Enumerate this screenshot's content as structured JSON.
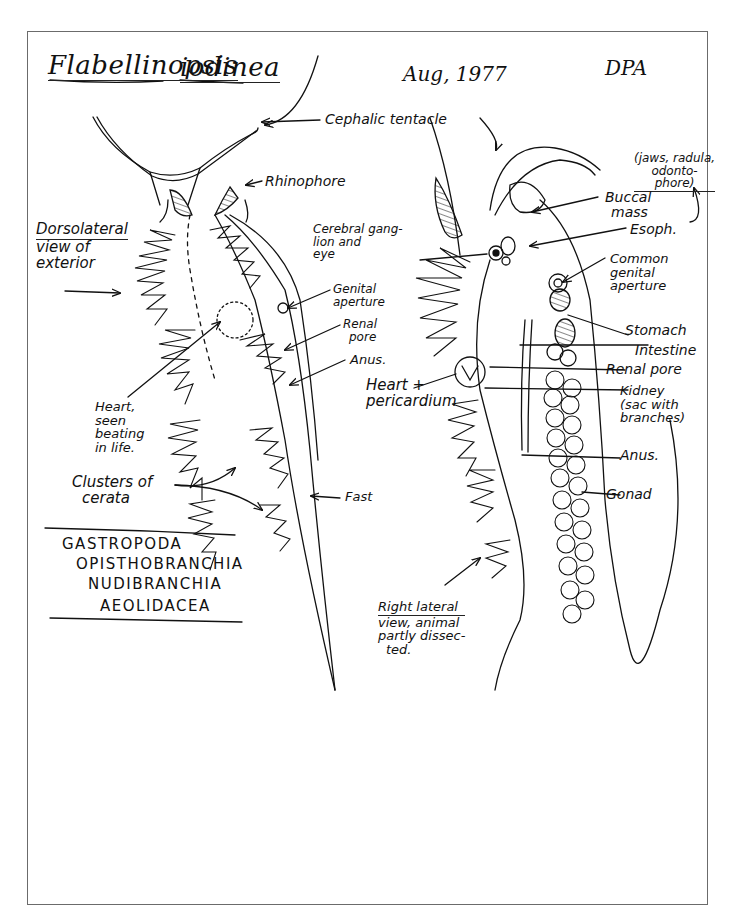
{
  "header": {
    "genus": "Flabellinopsis",
    "species": "iodinea",
    "date": "Aug, 1977",
    "initials": "DPA"
  },
  "taxonomy": [
    "GASTROPODA",
    "OPISTHOBRANCHIA",
    "NUDIBRANCHIA",
    "AEOLIDACEA"
  ],
  "left_view": {
    "caption": [
      "Dorsolateral",
      "view of",
      "exterior"
    ],
    "labels": {
      "heart": [
        "Heart,",
        "seen",
        "beating",
        "in life."
      ],
      "cerata": [
        "Clusters of",
        "cerata"
      ],
      "foot": "Fast"
    }
  },
  "shared_labels": {
    "cephalic_tentacle": "Cephalic tentacle",
    "rhinophore": "Rhinophore",
    "genital_aperture": [
      "Genital",
      "aperture"
    ],
    "renal_pore": [
      "Renal",
      "pore"
    ],
    "anus": "Anus.",
    "cerebral_ganglion": [
      "Cerebral gang-",
      "lion and",
      "eye"
    ],
    "heart_pericardium": [
      "Heart +",
      "pericardium"
    ]
  },
  "right_view": {
    "caption": [
      "Right lateral",
      "view, animal",
      "partly dissec-",
      "ted."
    ],
    "labels": {
      "jaws_note": [
        "(jaws, radula,",
        "odonto-",
        "phore)"
      ],
      "buccal_mass": [
        "Buccal",
        "mass"
      ],
      "esophagus": "Esoph.",
      "common_genital": [
        "Common",
        "genital",
        "aperture"
      ],
      "stomach": "Stomach",
      "intestine": "Intestine",
      "renal_pore": "Renal pore",
      "kidney": [
        "Kidney",
        "(sac with",
        "branches)"
      ],
      "anus": "Anus.",
      "gonad": "Gonad"
    }
  },
  "colors": {
    "ink": "#111111",
    "paper": "#ffffff",
    "frame": "#6b6b6b"
  }
}
